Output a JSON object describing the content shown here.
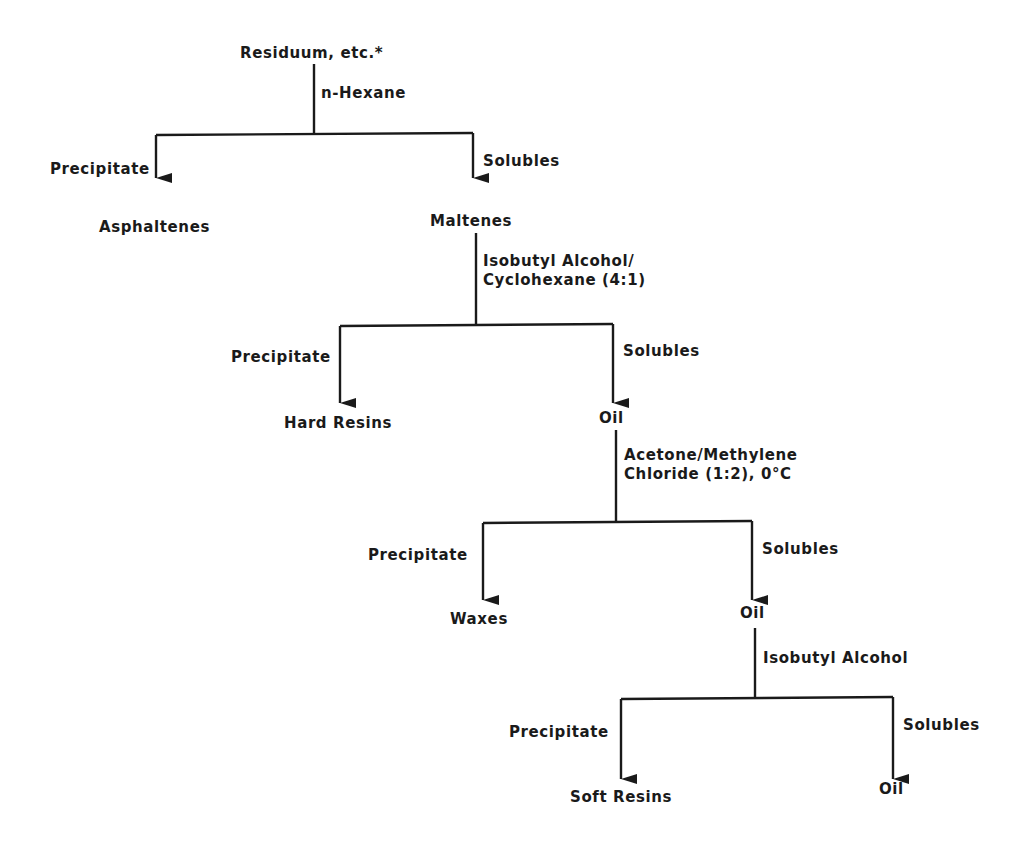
{
  "diagram": {
    "type": "fractionation-flowchart",
    "root": {
      "label": "Residuum, etc.*",
      "solvent": "n-Hexane"
    },
    "steps": [
      {
        "precipitate_label": "Precipitate",
        "precipitate_product": "Asphaltenes",
        "solubles_label": "Solubles",
        "solubles_product": "Maltenes",
        "next_solvent": "Isobutyl Alcohol/\nCyclohexane (4:1)"
      },
      {
        "precipitate_label": "Precipitate",
        "precipitate_product": "Hard Resins",
        "solubles_label": "Solubles",
        "solubles_product": "Oil",
        "next_solvent": "Acetone/Methylene\nChloride (1:2), 0°C"
      },
      {
        "precipitate_label": "Precipitate",
        "precipitate_product": "Waxes",
        "solubles_label": "Solubles",
        "solubles_product": "Oil",
        "next_solvent": "Isobutyl Alcohol"
      },
      {
        "precipitate_label": "Precipitate",
        "precipitate_product": "Soft Resins",
        "solubles_label": "Solubles",
        "solubles_product": "Oil"
      }
    ],
    "line_color": "#1a1a1a",
    "text_color": "#1a1a1a"
  }
}
